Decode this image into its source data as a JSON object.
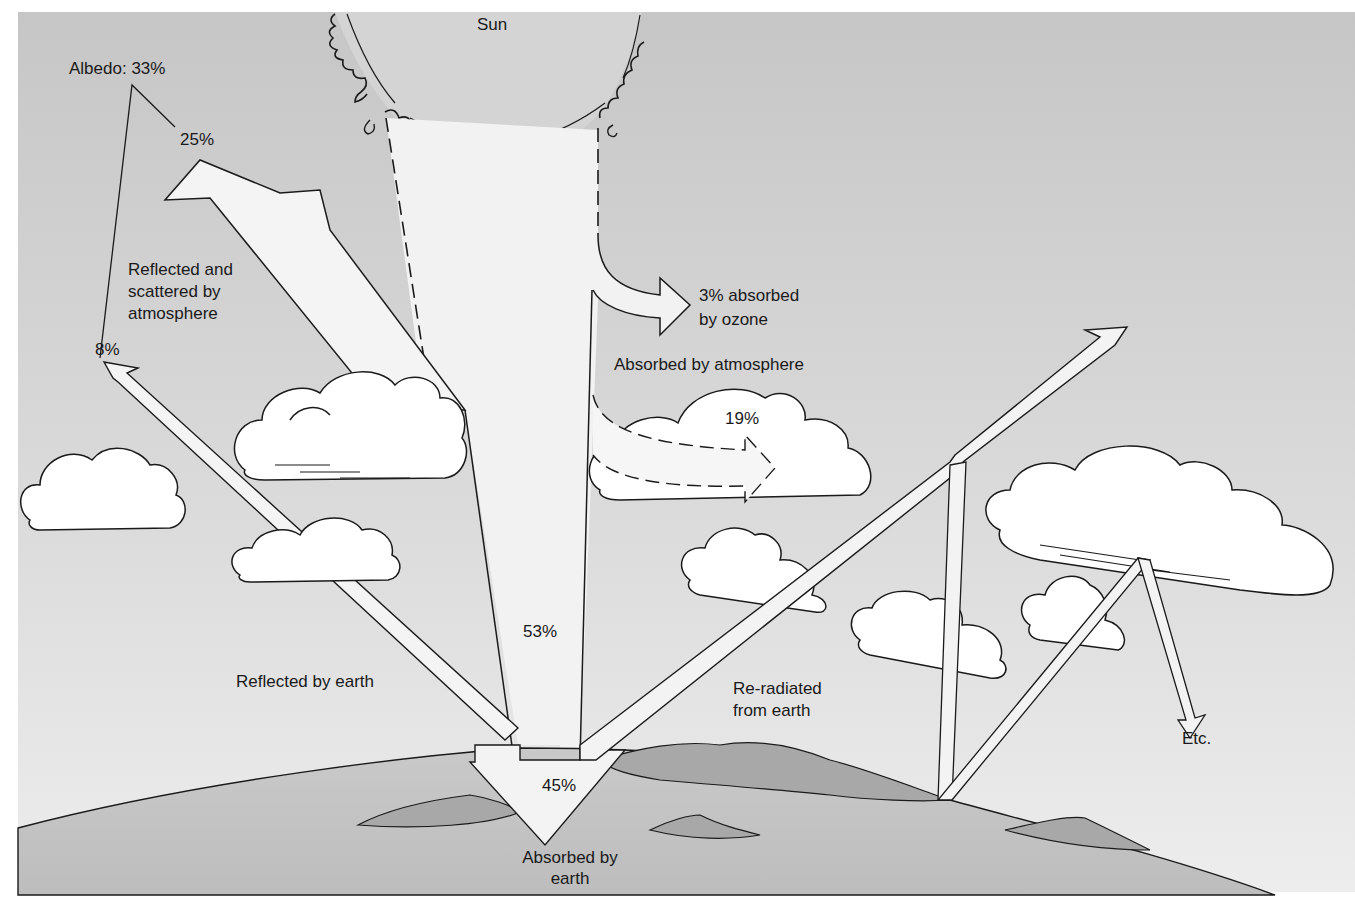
{
  "diagram": {
    "type": "radiation-budget",
    "colors": {
      "sky_top": "#c9c9c9",
      "sky_bottom": "#e6e6e6",
      "sun_fill": "#d6d6d6",
      "beam_fill": "#f3f3f3",
      "earth_fill": "#c4c4c4",
      "land_fill": "#a9a9a9",
      "cloud_fill": "#ffffff",
      "line": "#1a1a1a",
      "text": "#1a1a1a"
    },
    "labels": {
      "sun": "Sun",
      "albedo": "Albedo: 33%",
      "scattered_pct": "25%",
      "scattered_desc": "Reflected and\nscattered by\natmosphere",
      "reflected_earth_pct": "8%",
      "reflected_earth_desc": "Reflected by earth",
      "ozone": "3% absorbed\nby ozone",
      "atmosphere_desc": "Absorbed by atmosphere",
      "atmosphere_pct": "19%",
      "transmitted_pct": "53%",
      "earth_pct": "45%",
      "earth_desc": "Absorbed by\nearth",
      "reradiated": "Re-radiated\nfrom earth",
      "etc": "Etc."
    },
    "flows": [
      {
        "name": "Reflected and scattered by atmosphere",
        "percent": 25
      },
      {
        "name": "Reflected by earth",
        "percent": 8
      },
      {
        "name": "Albedo (total reflected)",
        "percent": 33
      },
      {
        "name": "Absorbed by ozone",
        "percent": 3
      },
      {
        "name": "Absorbed by atmosphere",
        "percent": 19
      },
      {
        "name": "Reaching surface",
        "percent": 53
      },
      {
        "name": "Absorbed by earth",
        "percent": 45
      }
    ]
  }
}
